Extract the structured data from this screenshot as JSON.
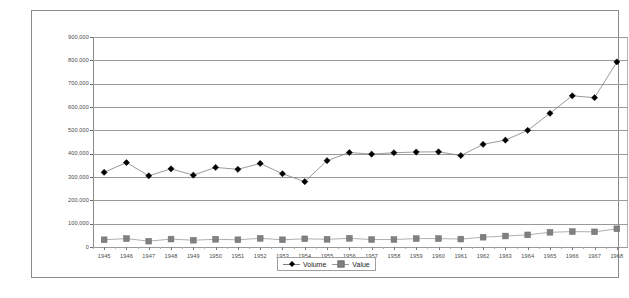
{
  "chart_data": {
    "type": "line",
    "title": "",
    "subtitle": "",
    "xlabel": "",
    "ylabel": "",
    "grid": true,
    "legend_position": "bottom",
    "ylim": [
      0,
      900000
    ],
    "ytick_step": 100000,
    "ytick_labels": [
      "900,000",
      "800,000",
      "700,000",
      "600,000",
      "500,000",
      "400,000",
      "300,000",
      "200,000",
      "100,000",
      "0"
    ],
    "ytick_values": [
      900000,
      800000,
      700000,
      600000,
      500000,
      400000,
      300000,
      200000,
      100000,
      0
    ],
    "categories": [
      "1945",
      "1946",
      "1947",
      "1948",
      "1949",
      "1950",
      "1951",
      "1952",
      "1953",
      "1954",
      "1955",
      "1956",
      "1957",
      "1958",
      "1959",
      "1960",
      "1961",
      "1962",
      "1963",
      "1964",
      "1965",
      "1966",
      "1967",
      "1968"
    ],
    "series": [
      {
        "name": "Volume",
        "marker": "diamond",
        "color": "#000000",
        "line_color": "#808080",
        "values": [
          320000,
          362000,
          305000,
          335000,
          308000,
          341000,
          333000,
          358000,
          314000,
          280000,
          370000,
          405000,
          398000,
          404000,
          407000,
          408000,
          392000,
          440000,
          458000,
          500000,
          573000,
          648000,
          640000,
          793000
        ]
      },
      {
        "name": "Value",
        "marker": "square",
        "color": "#808080",
        "line_color": "#9a9a9a",
        "values": [
          31000,
          36000,
          25000,
          34000,
          29000,
          33000,
          31000,
          37000,
          31000,
          35000,
          33000,
          37000,
          32000,
          32000,
          36000,
          36000,
          34000,
          42000,
          47000,
          52000,
          63000,
          66000,
          65000,
          78000
        ]
      }
    ]
  },
  "legend": {
    "entries": [
      {
        "label": "Volume"
      },
      {
        "label": "Value"
      }
    ]
  }
}
